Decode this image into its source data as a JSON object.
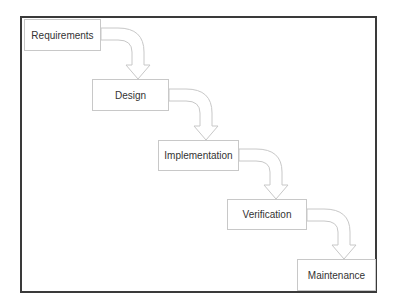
{
  "diagram": {
    "title": "",
    "type": "waterfall-process",
    "steps": [
      {
        "label": "Requirements"
      },
      {
        "label": "Design"
      },
      {
        "label": "Implementation"
      },
      {
        "label": "Verification"
      },
      {
        "label": "Maintenance"
      }
    ],
    "colors": {
      "frame": "#3a3a3a",
      "box_border": "#c8c8c8",
      "arrow_stroke": "#c8c8c8",
      "text": "#333333"
    }
  }
}
